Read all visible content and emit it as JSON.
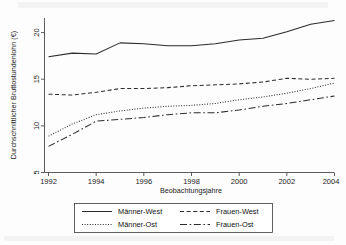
{
  "chart_data": {
    "type": "line",
    "title": "",
    "xlabel": "Beobachtungsjahre",
    "ylabel": "Durchschnittlicher Bruttostundenlohn (€)",
    "x": [
      1992,
      1993,
      1994,
      1995,
      1996,
      1997,
      1998,
      1999,
      2000,
      2001,
      2002,
      2003,
      2004
    ],
    "xlim": [
      1992,
      2004
    ],
    "ylim": [
      5,
      21.5
    ],
    "xticks": [
      1992,
      1994,
      1996,
      1998,
      2000,
      2002,
      2004
    ],
    "yticks": [
      5,
      10,
      15,
      20
    ],
    "xtick_labels": [
      "1992",
      "1994",
      "1996",
      "1998",
      "2000",
      "2002",
      "2004"
    ],
    "ytick_labels": [
      "5",
      "10",
      "15",
      "20"
    ],
    "grid": false,
    "legend_position": "below",
    "series": [
      {
        "name": "Männer-West",
        "style": "solid",
        "values": [
          17.4,
          17.8,
          17.7,
          18.9,
          18.8,
          18.6,
          18.6,
          18.8,
          19.2,
          19.4,
          20.1,
          20.9,
          21.3
        ]
      },
      {
        "name": "Frauen-West",
        "style": "dashed",
        "values": [
          13.4,
          13.3,
          13.6,
          14.0,
          14.0,
          14.1,
          14.3,
          14.4,
          14.5,
          14.7,
          15.1,
          15.0,
          15.1
        ]
      },
      {
        "name": "Männer-Ost",
        "style": "dotted",
        "values": [
          8.9,
          10.2,
          11.2,
          11.6,
          11.9,
          12.1,
          12.2,
          12.4,
          12.8,
          13.1,
          13.5,
          14.0,
          14.6
        ]
      },
      {
        "name": "Frauen-Ost",
        "style": "longdash",
        "values": [
          7.8,
          9.1,
          10.5,
          10.7,
          10.9,
          11.2,
          11.4,
          11.4,
          11.7,
          12.1,
          12.4,
          12.8,
          13.2
        ]
      }
    ]
  },
  "legend": {
    "entries": [
      {
        "label": "Männer-West",
        "style": "solid"
      },
      {
        "label": "Frauen-West",
        "style": "dashed"
      },
      {
        "label": "Männer-Ost",
        "style": "dotted"
      },
      {
        "label": "Frauen-Ost",
        "style": "longdash"
      }
    ]
  },
  "colors": {
    "line": "#2b2b2b",
    "axis": "#4a4a4a",
    "text": "#1a1a1a",
    "background": "#fdfdfd"
  }
}
